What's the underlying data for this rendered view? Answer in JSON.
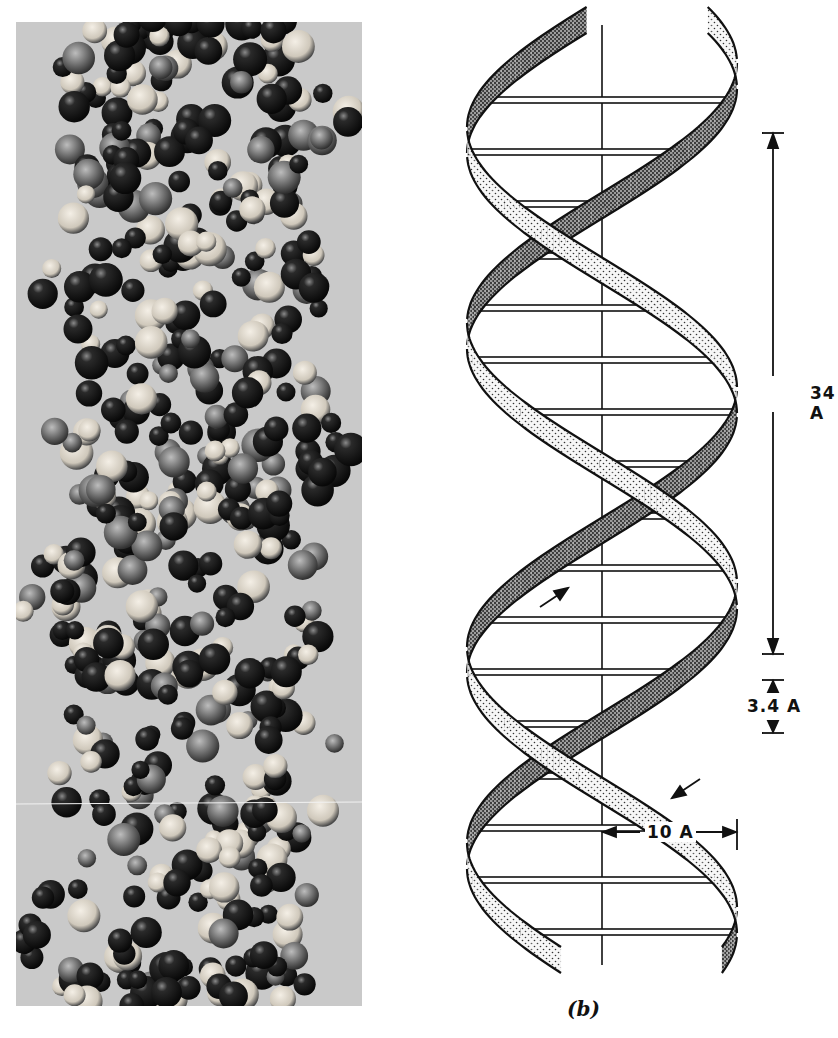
{
  "figure": {
    "panel_a": {
      "description": "Photograph of space-filling molecular model of DNA double helix",
      "background_color": "#c9c9c9",
      "atom_colors": [
        "#1a1a1a",
        "#e8e2d6",
        "#7a7a7a"
      ]
    },
    "panel_b": {
      "label": "(b)",
      "description": "Schematic of the DNA double helix with ribbon backbones and horizontal base-pair rungs",
      "dimensions": {
        "pitch": "34 A",
        "base_spacing": "3.4 A",
        "radius": "10 A"
      },
      "strand_direction_arrows": [
        "up-right",
        "down-left"
      ]
    },
    "caption_cut_off": true
  }
}
